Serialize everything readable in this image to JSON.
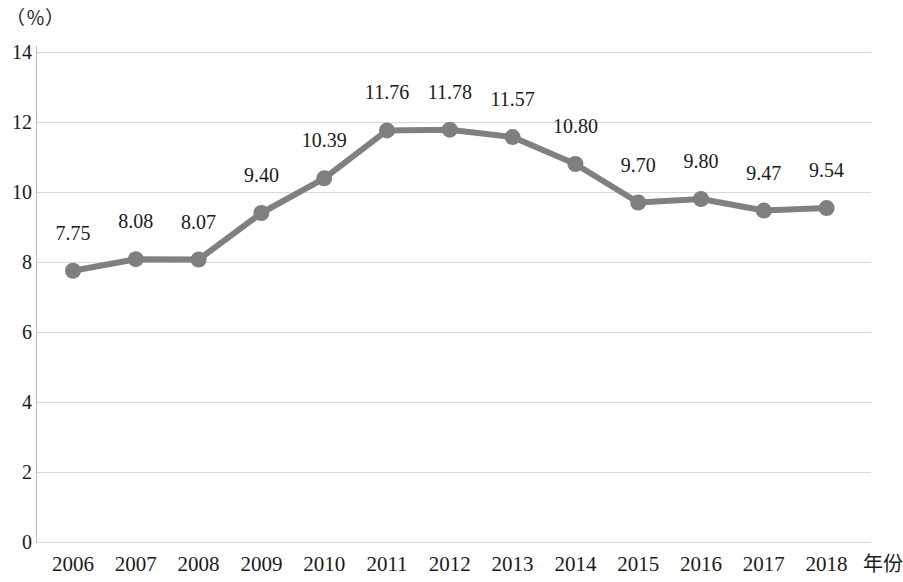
{
  "chart_data": {
    "type": "line",
    "title": "",
    "subtitle": "",
    "xlabel": "年份",
    "ylabel": "（％）",
    "ylim": [
      0,
      14
    ],
    "ytick_step": 2,
    "yticks": [
      "0",
      "2",
      "4",
      "6",
      "8",
      "10",
      "12",
      "14"
    ],
    "grid": true,
    "legend": "none",
    "categories": [
      "2006",
      "2007",
      "2008",
      "2009",
      "2010",
      "2011",
      "2012",
      "2013",
      "2014",
      "2015",
      "2016",
      "2017",
      "2018"
    ],
    "values": [
      7.75,
      8.08,
      8.07,
      9.4,
      10.39,
      11.76,
      11.78,
      11.57,
      10.8,
      9.7,
      9.8,
      9.47,
      9.54
    ],
    "point_labels": [
      "7.75",
      "8.08",
      "8.07",
      "9.40",
      "10.39",
      "11.76",
      "11.78",
      "11.57",
      "10.80",
      "9.70",
      "9.80",
      "9.47",
      "9.54"
    ],
    "series": [
      {
        "name": "",
        "values": [
          7.75,
          8.08,
          8.07,
          9.4,
          10.39,
          11.76,
          11.78,
          11.57,
          10.8,
          9.7,
          9.8,
          9.47,
          9.54
        ]
      }
    ],
    "colors": {
      "line": "#808080",
      "marker": "#7f7f7f",
      "grid": "#d9d9d9",
      "axis": "#b9b9b9",
      "text": "#1a1a1a",
      "background": "#ffffff"
    }
  }
}
